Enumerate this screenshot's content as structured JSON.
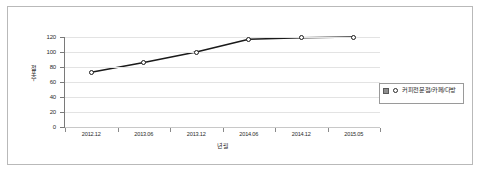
{
  "chart_data": {
    "type": "line",
    "title": "",
    "xlabel": "년월",
    "ylabel": "점포수",
    "categories": [
      "2012.12",
      "2013.06",
      "2013.12",
      "2014.06",
      "2014.12",
      "2015.05"
    ],
    "series": [
      {
        "name": "커피전문점/카페/다방",
        "values": [
          73,
          86,
          100,
          117,
          119,
          120
        ],
        "marker": "open-circle",
        "line_color": "#1a1a1a"
      }
    ],
    "ylim": [
      0,
      120
    ],
    "yticks": [
      0,
      20,
      40,
      60,
      80,
      100,
      120
    ],
    "ytick_labels": [
      "0",
      "20",
      "40",
      "60",
      "80",
      "100",
      "120"
    ],
    "grid": true,
    "grid_axis": "y",
    "legend_position": "right"
  },
  "legend": {
    "entries": [
      {
        "label": "커피전문점/카페/다방",
        "checkbox_checked": true,
        "marker": "open-circle"
      }
    ]
  },
  "colors": {
    "line": "#1a1a1a",
    "grid": "#e3e3e3",
    "axis": "#7a7a7a",
    "frame": "#b9b9b9",
    "background": "#ffffff",
    "text": "#2b2b2b"
  }
}
